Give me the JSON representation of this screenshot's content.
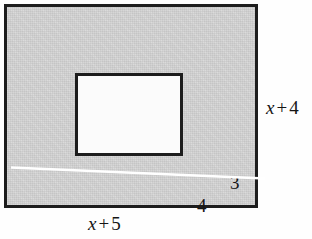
{
  "figure": {
    "type": "geometry-diagram",
    "outer_rectangle": {
      "name": "shaded-outer-rectangle",
      "fill_color": "#d2d2d2",
      "border_color": "#1d1d1d",
      "width_label": "x + 5",
      "width_label_variable": "x",
      "width_label_operator": "+",
      "width_label_constant": "5",
      "height_label": "x + 4",
      "height_label_variable": "x",
      "height_label_operator": "+",
      "height_label_constant": "4"
    },
    "inner_rectangle": {
      "name": "white-inner-rectangle",
      "fill_color": "#fbfbfb",
      "border_color": "#1d1d1d",
      "height_label": "3",
      "width_label": "4"
    },
    "background_color": "#ffffff"
  },
  "labels": {
    "inner_height": "3",
    "inner_width": "4",
    "outer_height": {
      "variable": "x",
      "operator": "+",
      "constant": "4"
    },
    "outer_width": {
      "variable": "x",
      "operator": "+",
      "constant": "5"
    }
  }
}
